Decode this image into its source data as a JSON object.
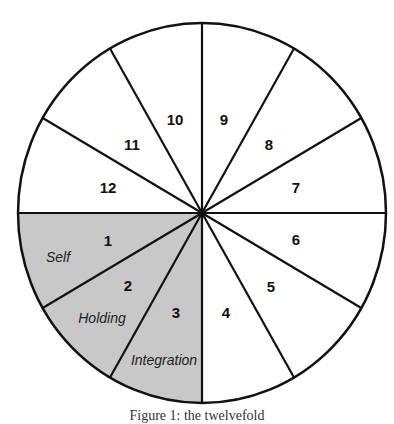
{
  "diagram": {
    "type": "circle-divided-into-segments",
    "segment_count": 12,
    "colors": {
      "stroke": "#111111",
      "shaded_fill": "#c8c8c8",
      "plain_fill": "#ffffff"
    },
    "segments": [
      {
        "number": "1",
        "label": "Self",
        "shaded": true
      },
      {
        "number": "2",
        "label": "Holding",
        "shaded": true
      },
      {
        "number": "3",
        "label": "Integration",
        "shaded": true
      },
      {
        "number": "4",
        "label": "",
        "shaded": false
      },
      {
        "number": "5",
        "label": "",
        "shaded": false
      },
      {
        "number": "6",
        "label": "",
        "shaded": false
      },
      {
        "number": "7",
        "label": "",
        "shaded": false
      },
      {
        "number": "8",
        "label": "",
        "shaded": false
      },
      {
        "number": "9",
        "label": "",
        "shaded": false
      },
      {
        "number": "10",
        "label": "",
        "shaded": false
      },
      {
        "number": "11",
        "label": "",
        "shaded": false
      },
      {
        "number": "12",
        "label": "",
        "shaded": false
      }
    ]
  },
  "caption": "Figure 1: the twelvefold"
}
